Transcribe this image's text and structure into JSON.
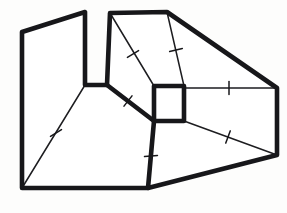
{
  "figure": {
    "title": "Geometric net diagram",
    "canvas": {
      "width": 287,
      "height": 213
    },
    "colors": {
      "background": "#fdfdfc",
      "ink": "#17171a",
      "fold_ink": "#1d1d20",
      "face": "#ffffff"
    },
    "stroke_widths": {
      "outline": 4.6,
      "fold": 1.5,
      "tick": 1.5
    },
    "vertices": {
      "top_left_upper": [
        22,
        32
      ],
      "notch_apex_left": [
        85,
        12
      ],
      "notch_base_left": [
        85,
        85
      ],
      "notch_base_right": [
        107,
        85
      ],
      "notch_apex_right": [
        110,
        13
      ],
      "top_ridge_right": [
        167,
        12
      ],
      "right_upper": [
        277,
        88
      ],
      "right_lower": [
        277,
        155
      ],
      "bottom_right_fold": [
        148,
        188
      ],
      "bottom_left": [
        22,
        188
      ],
      "square_top_left": [
        154,
        86
      ],
      "square_top_right": [
        184,
        86
      ],
      "square_bottom_right": [
        184,
        121
      ],
      "square_bottom_left": [
        154,
        121
      ]
    },
    "outline_path": "M 22 32 L 85 12 L 85 85 L 107 85 L 110 13 L 167 12 L 277 88 L 277 155 L 148 188 L 22 188 Z",
    "edges": {
      "outline": [
        {
          "name": "upper-left-slant",
          "from": [
            22,
            32
          ],
          "to": [
            85,
            12
          ]
        },
        {
          "name": "notch-left-wall",
          "from": [
            85,
            12
          ],
          "to": [
            85,
            85
          ]
        },
        {
          "name": "notch-base",
          "from": [
            85,
            85
          ],
          "to": [
            107,
            85
          ]
        },
        {
          "name": "notch-right-wall",
          "from": [
            107,
            85
          ],
          "to": [
            110,
            13
          ]
        },
        {
          "name": "top-ridge",
          "from": [
            110,
            13
          ],
          "to": [
            167,
            12
          ]
        },
        {
          "name": "upper-right-slant",
          "from": [
            167,
            12
          ],
          "to": [
            277,
            88
          ]
        },
        {
          "name": "right-wall",
          "from": [
            277,
            88
          ],
          "to": [
            277,
            155
          ]
        },
        {
          "name": "lower-right-slant",
          "from": [
            277,
            155
          ],
          "to": [
            148,
            188
          ]
        },
        {
          "name": "bottom-edge",
          "from": [
            148,
            188
          ],
          "to": [
            22,
            188
          ]
        },
        {
          "name": "left-wall",
          "from": [
            22,
            188
          ],
          "to": [
            22,
            32
          ]
        },
        {
          "name": "notch-to-square-diagonal",
          "from": [
            107,
            85
          ],
          "to": [
            154,
            121
          ]
        },
        {
          "name": "square-to-bottom-vertical",
          "from": [
            154,
            121
          ],
          "to": [
            148,
            188
          ]
        }
      ],
      "square_panel": [
        {
          "name": "square-top",
          "from": [
            154,
            86
          ],
          "to": [
            184,
            86
          ]
        },
        {
          "name": "square-right",
          "from": [
            184,
            86
          ],
          "to": [
            184,
            121
          ]
        },
        {
          "name": "square-bottom",
          "from": [
            184,
            121
          ],
          "to": [
            154,
            121
          ]
        },
        {
          "name": "square-left",
          "from": [
            154,
            121
          ],
          "to": [
            154,
            86
          ]
        }
      ],
      "folds": [
        {
          "name": "fold-top-ridge-to-square",
          "from": [
            110,
            13
          ],
          "to": [
            154,
            86
          ]
        },
        {
          "name": "fold-right-ridge-to-square",
          "from": [
            167,
            12
          ],
          "to": [
            184,
            86
          ]
        },
        {
          "name": "fold-square-to-right-wall",
          "from": [
            184,
            88
          ],
          "to": [
            277,
            88
          ]
        },
        {
          "name": "fold-square-to-right-lower",
          "from": [
            184,
            121
          ],
          "to": [
            277,
            155
          ]
        },
        {
          "name": "fold-notch-base-to-bottom-left",
          "from": [
            85,
            85
          ],
          "to": [
            22,
            188
          ]
        }
      ]
    },
    "tick_marks": [
      {
        "name": "tick-top-ridge-fold",
        "at": [
          133,
          54
        ],
        "angle": 59
      },
      {
        "name": "tick-right-ridge-fold",
        "at": [
          176,
          50
        ],
        "angle": 77
      },
      {
        "name": "tick-square-right-horizontal",
        "at": [
          229,
          88
        ],
        "angle": 0
      },
      {
        "name": "tick-square-right-lower",
        "at": [
          228,
          137
        ],
        "angle": 20
      },
      {
        "name": "tick-notch-diagonal",
        "at": [
          128,
          101
        ],
        "angle": 38
      },
      {
        "name": "tick-left-fold",
        "at": [
          56,
          133
        ],
        "angle": 58
      },
      {
        "name": "tick-square-bottom-vertical",
        "at": [
          151,
          156
        ],
        "angle": 85
      }
    ]
  }
}
